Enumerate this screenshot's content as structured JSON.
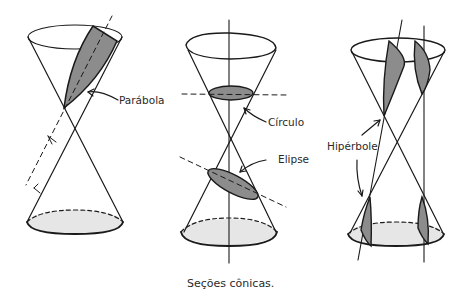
{
  "diagram": {
    "caption": "Seções cônicas.",
    "labels": {
      "parabola": "Parábola",
      "circle": "Círculo",
      "ellipse": "Elipse",
      "hyperbole": "Hipérbole"
    },
    "colors": {
      "line": "#1a1a1a",
      "section_fill": "#8c8c8c",
      "base_fill": "#e6e6e6"
    }
  }
}
